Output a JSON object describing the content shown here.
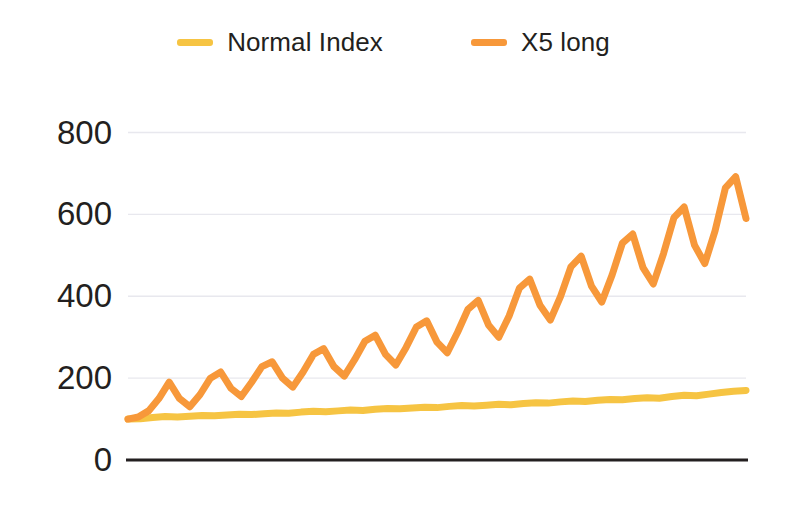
{
  "legend": {
    "position": "top-center",
    "entries": [
      {
        "label": "Normal Index",
        "color": "#f6c443",
        "swatch_name": "legend-swatch-normal-index"
      },
      {
        "label": "X5 long",
        "color": "#f7983a",
        "swatch_name": "legend-swatch-x5-long"
      }
    ]
  },
  "axis": {
    "y_ticks": [
      "800",
      "600",
      "400",
      "200",
      "0"
    ],
    "x_axis_color": "#231f20",
    "gridline_color": "#e8e8ee"
  },
  "chart_data": {
    "type": "line",
    "title": "",
    "subtitle": "",
    "xlabel": "",
    "ylabel": "",
    "ylim": [
      0,
      860
    ],
    "xlim": [
      0,
      100
    ],
    "grid": true,
    "grid_axis": "y",
    "yticks": [
      0,
      200,
      400,
      600,
      800
    ],
    "xticks": [],
    "legend_position": "top-center",
    "background": "#ffffff",
    "series": [
      {
        "name": "Normal Index",
        "color": "#f6c443",
        "line_width": 7,
        "x": [
          0,
          2,
          4,
          6,
          8,
          10,
          12,
          14,
          16,
          18,
          20,
          22,
          24,
          26,
          28,
          30,
          32,
          34,
          36,
          38,
          40,
          42,
          44,
          46,
          48,
          50,
          52,
          54,
          56,
          58,
          60,
          62,
          64,
          66,
          68,
          70,
          72,
          74,
          76,
          78,
          80,
          82,
          84,
          86,
          88,
          90,
          92,
          94,
          96,
          98,
          100
        ],
        "values": [
          100,
          101,
          104,
          106,
          105,
          107,
          109,
          108,
          110,
          112,
          111,
          113,
          115,
          114,
          117,
          119,
          118,
          120,
          122,
          121,
          124,
          126,
          125,
          127,
          129,
          128,
          131,
          133,
          132,
          134,
          136,
          135,
          138,
          140,
          139,
          142,
          144,
          143,
          146,
          148,
          147,
          150,
          152,
          151,
          155,
          158,
          157,
          161,
          165,
          168,
          170
        ]
      },
      {
        "name": "X5 long",
        "color": "#f7983a",
        "line_width": 7,
        "x": [
          0,
          2,
          4,
          6,
          8,
          10,
          12,
          14,
          16,
          18,
          20,
          22,
          24,
          26,
          28,
          30,
          32,
          34,
          36,
          38,
          40,
          42,
          44,
          46,
          48,
          50,
          52,
          54,
          56,
          58,
          60,
          62,
          64,
          66,
          68,
          70,
          72,
          74,
          76,
          78,
          80,
          82,
          84,
          86,
          88,
          90,
          92,
          94,
          96,
          98,
          100
        ],
        "values": [
          100,
          105,
          120,
          150,
          190,
          150,
          130,
          160,
          200,
          215,
          175,
          155,
          190,
          228,
          240,
          200,
          178,
          215,
          258,
          272,
          228,
          205,
          245,
          290,
          305,
          258,
          232,
          275,
          325,
          340,
          288,
          262,
          312,
          368,
          390,
          330,
          300,
          352,
          420,
          442,
          378,
          342,
          400,
          472,
          498,
          425,
          386,
          452,
          530,
          552,
          470
        ],
        "extended_x": [
          102,
          104,
          106,
          108,
          110,
          112,
          114,
          116,
          118,
          120
        ],
        "extended_values": [
          430,
          505,
          592,
          618,
          525,
          480,
          560,
          665,
          692,
          590
        ]
      }
    ],
    "series_x5_long_full": {
      "note": "sawtooth oscillation with rising trend",
      "peaks": [
        190,
        215,
        240,
        272,
        305,
        340,
        390,
        442,
        498,
        552,
        618,
        692,
        760
      ],
      "troughs": [
        130,
        155,
        178,
        205,
        232,
        262,
        300,
        342,
        386,
        430,
        480,
        525,
        650
      ],
      "start_value": 100,
      "end_value": 650,
      "max_value": 760,
      "cycles": 13
    }
  }
}
